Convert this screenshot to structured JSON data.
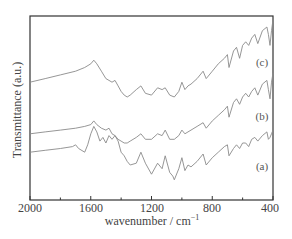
{
  "chart_data": {
    "type": "line",
    "title": "",
    "xlabel": "wavenumber / cm",
    "xlabel_superscript": "−1",
    "ylabel": "Transmittance (a.u.)",
    "xlim": [
      2000,
      400
    ],
    "x_reversed": true,
    "x_ticks": [
      2000,
      1600,
      1200,
      800,
      400
    ],
    "x_tick_labels": [
      "2000",
      "1600",
      "1200",
      "800",
      "400"
    ],
    "y_ticks": [],
    "grid": false,
    "legend": "inline labels at right",
    "series": [
      {
        "name": "(c)",
        "offset_note": "top trace",
        "x": [
          2000,
          1900,
          1800,
          1700,
          1640,
          1600,
          1580,
          1560,
          1530,
          1500,
          1480,
          1460,
          1440,
          1420,
          1400,
          1380,
          1360,
          1340,
          1300,
          1270,
          1240,
          1200,
          1160,
          1130,
          1110,
          1080,
          1050,
          1020,
          1000,
          980,
          960,
          940,
          900,
          860,
          840,
          800,
          760,
          720,
          700,
          690,
          660,
          640,
          620,
          600,
          580,
          560,
          540,
          520,
          500,
          470,
          440,
          430,
          420,
          410,
          400
        ],
        "y": [
          0.64,
          0.66,
          0.68,
          0.7,
          0.72,
          0.74,
          0.76,
          0.74,
          0.7,
          0.66,
          0.65,
          0.64,
          0.65,
          0.62,
          0.59,
          0.57,
          0.56,
          0.57,
          0.6,
          0.62,
          0.58,
          0.57,
          0.61,
          0.6,
          0.61,
          0.57,
          0.56,
          0.59,
          0.64,
          0.6,
          0.62,
          0.63,
          0.66,
          0.7,
          0.66,
          0.7,
          0.74,
          0.77,
          0.79,
          0.72,
          0.81,
          0.83,
          0.77,
          0.84,
          0.86,
          0.84,
          0.88,
          0.9,
          0.85,
          0.92,
          0.94,
          0.9,
          0.84,
          0.92,
          0.98
        ]
      },
      {
        "name": "(b)",
        "offset_note": "middle trace",
        "x": [
          2000,
          1900,
          1800,
          1700,
          1640,
          1600,
          1580,
          1560,
          1530,
          1500,
          1480,
          1460,
          1440,
          1420,
          1400,
          1380,
          1360,
          1340,
          1300,
          1270,
          1240,
          1200,
          1160,
          1130,
          1110,
          1080,
          1050,
          1020,
          1000,
          980,
          960,
          940,
          900,
          860,
          840,
          800,
          760,
          720,
          700,
          690,
          660,
          640,
          620,
          600,
          580,
          560,
          540,
          520,
          500,
          470,
          440,
          430,
          420,
          410,
          400
        ],
        "y": [
          0.36,
          0.37,
          0.38,
          0.39,
          0.4,
          0.41,
          0.43,
          0.41,
          0.39,
          0.38,
          0.39,
          0.36,
          0.35,
          0.33,
          0.32,
          0.31,
          0.31,
          0.32,
          0.34,
          0.36,
          0.33,
          0.33,
          0.36,
          0.35,
          0.38,
          0.33,
          0.33,
          0.35,
          0.38,
          0.36,
          0.37,
          0.38,
          0.4,
          0.42,
          0.39,
          0.43,
          0.46,
          0.49,
          0.51,
          0.45,
          0.53,
          0.55,
          0.52,
          0.56,
          0.58,
          0.56,
          0.59,
          0.61,
          0.57,
          0.63,
          0.65,
          0.6,
          0.55,
          0.64,
          0.69
        ]
      },
      {
        "name": "(a)",
        "offset_note": "bottom trace",
        "x": [
          2000,
          1900,
          1800,
          1720,
          1700,
          1680,
          1640,
          1620,
          1600,
          1580,
          1560,
          1540,
          1520,
          1500,
          1480,
          1460,
          1440,
          1420,
          1400,
          1380,
          1360,
          1340,
          1300,
          1270,
          1240,
          1200,
          1160,
          1130,
          1110,
          1080,
          1060,
          1050,
          1020,
          1000,
          980,
          960,
          940,
          900,
          860,
          840,
          800,
          760,
          720,
          700,
          690,
          660,
          640,
          620,
          600,
          580,
          560,
          540,
          520,
          500,
          470,
          440,
          430,
          420,
          410,
          400
        ],
        "y": [
          0.26,
          0.27,
          0.28,
          0.29,
          0.3,
          0.28,
          0.26,
          0.3,
          0.36,
          0.4,
          0.37,
          0.32,
          0.34,
          0.31,
          0.35,
          0.33,
          0.35,
          0.32,
          0.26,
          0.24,
          0.21,
          0.19,
          0.2,
          0.26,
          0.2,
          0.14,
          0.2,
          0.17,
          0.24,
          0.15,
          0.13,
          0.11,
          0.17,
          0.23,
          0.16,
          0.19,
          0.18,
          0.21,
          0.25,
          0.19,
          0.23,
          0.26,
          0.29,
          0.3,
          0.24,
          0.28,
          0.3,
          0.28,
          0.31,
          0.31,
          0.29,
          0.33,
          0.34,
          0.32,
          0.35,
          0.37,
          0.33,
          0.34,
          0.36,
          0.38
        ]
      }
    ],
    "annotations": [
      {
        "text": "(c)",
        "x": 460,
        "y": 0.79
      },
      {
        "text": "(b)",
        "x": 460,
        "y": 0.46
      },
      {
        "text": "(a)",
        "x": 460,
        "y": 0.16
      }
    ],
    "line_color": "#8a8a8a"
  },
  "axes": {
    "ylabel": "Transmittance (a.u.)",
    "xlabel": "wavenumber / cm",
    "xlabel_sup": "−1",
    "ticks": [
      "2000",
      "1600",
      "1200",
      "800",
      "400"
    ]
  },
  "labels": {
    "a": "(a)",
    "b": "(b)",
    "c": "(c)"
  }
}
